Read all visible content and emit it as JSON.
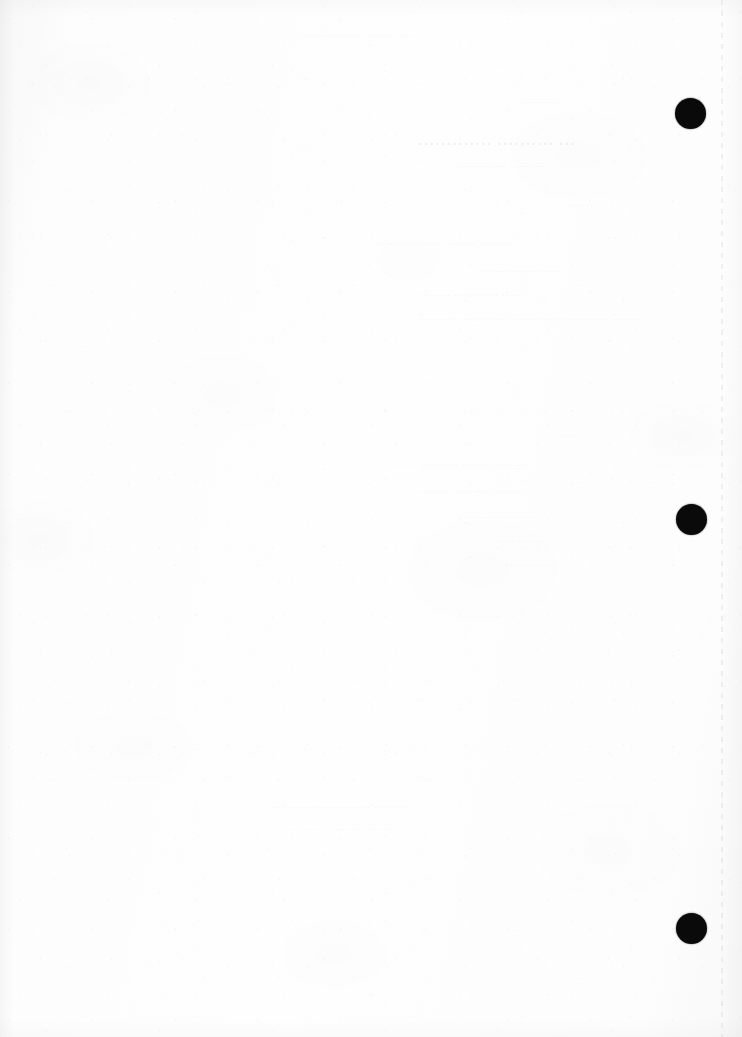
{
  "page": {
    "kind": "scanned-document-page",
    "width": 742,
    "height": 1037,
    "background_color": "#fcfcfc",
    "paper_tone": "#fbfbfc",
    "ink_color": "#0a0a0a",
    "condition": "near-blank recto; only faint mirrored bleed-through from the reverse side is visible",
    "legibility_note": "Bleed-through text is too faint to read; rendered as illegible ghost marks."
  },
  "marks": {
    "label": "registration marks",
    "shape": "filled circle",
    "color": "#0a0a0a",
    "diameter": 31,
    "items": [
      {
        "name": "registration-mark-top",
        "cx": 690,
        "cy": 113,
        "d": 31
      },
      {
        "name": "registration-mark-middle",
        "cx": 691,
        "cy": 519,
        "d": 31
      },
      {
        "name": "registration-mark-bottom",
        "cx": 691,
        "cy": 928,
        "d": 31
      }
    ]
  },
  "artifact": {
    "name": "scanner-dashed-line",
    "orientation": "vertical",
    "x": 721,
    "color": "#000000",
    "style": "dashed"
  },
  "ghost_text": {
    "note": "Mirrored show-through from the verso. Glyph shapes only — no confidently readable words.",
    "blocks": [
      {
        "id": "g1",
        "top": 30,
        "left": 300,
        "width": 340,
        "class": "g-small ghost-right",
        "text": "····· ········· ······ ·············"
      },
      {
        "id": "g2",
        "top": 96,
        "left": 440,
        "width": 200,
        "class": "g-sub ghost-center",
        "text": "·············"
      },
      {
        "id": "g3",
        "top": 134,
        "left": 352,
        "width": 288,
        "class": "g-title ghost-center",
        "text": "··· ·········· ·············"
      },
      {
        "id": "g4",
        "top": 160,
        "left": 360,
        "width": 280,
        "class": "g-sub ghost-center",
        "text": "··· ········· ······ ············"
      },
      {
        "id": "g5",
        "top": 198,
        "left": 520,
        "width": 120,
        "class": "g-body ghost-center",
        "text": "·······"
      },
      {
        "id": "g6",
        "top": 236,
        "left": 250,
        "width": 390,
        "class": "g-body ghost-center",
        "text": "········· ········ ··········· ······"
      },
      {
        "id": "g7",
        "top": 264,
        "left": 400,
        "width": 240,
        "class": "g-body ghost-center",
        "text": "············ ········"
      },
      {
        "id": "g8",
        "top": 288,
        "left": 300,
        "width": 340,
        "class": "g-body ghost-center",
        "text": "······ ············ ·········"
      },
      {
        "id": "g9",
        "top": 312,
        "left": 155,
        "width": 485,
        "class": "g-body",
        "text": "········ ············ ·············· ············ ··········"
      },
      {
        "id": "g10",
        "top": 430,
        "left": 560,
        "width": 80,
        "class": "g-small ghost-right ghost-center",
        "text": "······"
      },
      {
        "id": "g11",
        "top": 458,
        "left": 280,
        "width": 360,
        "class": "g-body ghost-center",
        "text": "·········· ······· ············· ····"
      },
      {
        "id": "g12",
        "top": 484,
        "left": 300,
        "width": 340,
        "class": "g-body ghost-center",
        "text": "······· ··········· ········"
      },
      {
        "id": "g13",
        "top": 510,
        "left": 350,
        "width": 290,
        "class": "g-body ghost-center",
        "text": "··········· ·········"
      },
      {
        "id": "g14",
        "top": 534,
        "left": 400,
        "width": 240,
        "class": "g-body ghost-center",
        "text": "········ ······"
      },
      {
        "id": "g15",
        "top": 558,
        "left": 420,
        "width": 220,
        "class": "g-body ghost-center",
        "text": "·············"
      },
      {
        "id": "g16",
        "top": 800,
        "left": 270,
        "width": 370,
        "class": "g-body ghost-right",
        "text": "·········· ·············· ············"
      },
      {
        "id": "g17",
        "top": 824,
        "left": 290,
        "width": 350,
        "class": "g-small ghost-right",
        "text": "········ ··········· ···········"
      },
      {
        "id": "g18",
        "top": 994,
        "left": 660,
        "width": 78,
        "class": "g-small g-faint",
        "text": "······"
      }
    ]
  }
}
